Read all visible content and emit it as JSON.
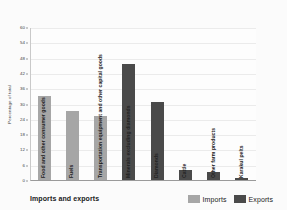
{
  "chart_data": {
    "type": "bar",
    "title": "Imports and exports",
    "xlabel": "",
    "ylabel": "Percentage of total",
    "ylim": [
      0,
      60
    ],
    "yticks": [
      0,
      6,
      12,
      18,
      24,
      30,
      36,
      42,
      48,
      54,
      60
    ],
    "grid": true,
    "legend_position": "bottom-right",
    "categories": [
      "Food and other consumer goods",
      "Fuels",
      "Transportation equipment and other capital goods",
      "Minerals excluding diamonds",
      "Diamonds",
      "Cattle",
      "Other farm products",
      "Karakul pelts"
    ],
    "series": [
      {
        "name": "Imports",
        "color": "#a6a6a6",
        "values": [
          33,
          27,
          25,
          null,
          null,
          null,
          null,
          null
        ]
      },
      {
        "name": "Exports",
        "color": "#4a4a4a",
        "values": [
          null,
          null,
          null,
          45.5,
          30.5,
          4,
          3,
          0.6
        ]
      }
    ],
    "bars": [
      {
        "category": "Food and other consumer goods",
        "series": "Imports",
        "value": 33
      },
      {
        "category": "Fuels",
        "series": "Imports",
        "value": 27
      },
      {
        "category": "Transportation equipment and other capital goods",
        "series": "Imports",
        "value": 25
      },
      {
        "category": "Minerals excluding diamonds",
        "series": "Exports",
        "value": 45.5
      },
      {
        "category": "Diamonds",
        "series": "Exports",
        "value": 30.5
      },
      {
        "category": "Cattle",
        "series": "Exports",
        "value": 4
      },
      {
        "category": "Other farm products",
        "series": "Exports",
        "value": 3
      },
      {
        "category": "Karakul pelts",
        "series": "Exports",
        "value": 0.6
      }
    ]
  },
  "legend": {
    "items": [
      {
        "label": "Imports",
        "color": "#a6a6a6"
      },
      {
        "label": "Exports",
        "color": "#4a4a4a"
      }
    ]
  },
  "colors": {
    "imports": "#a6a6a6",
    "exports": "#4a4a4a",
    "background": "#fbfbfb",
    "gridline": "#ebebeb",
    "axis": "#9a9a9a"
  }
}
